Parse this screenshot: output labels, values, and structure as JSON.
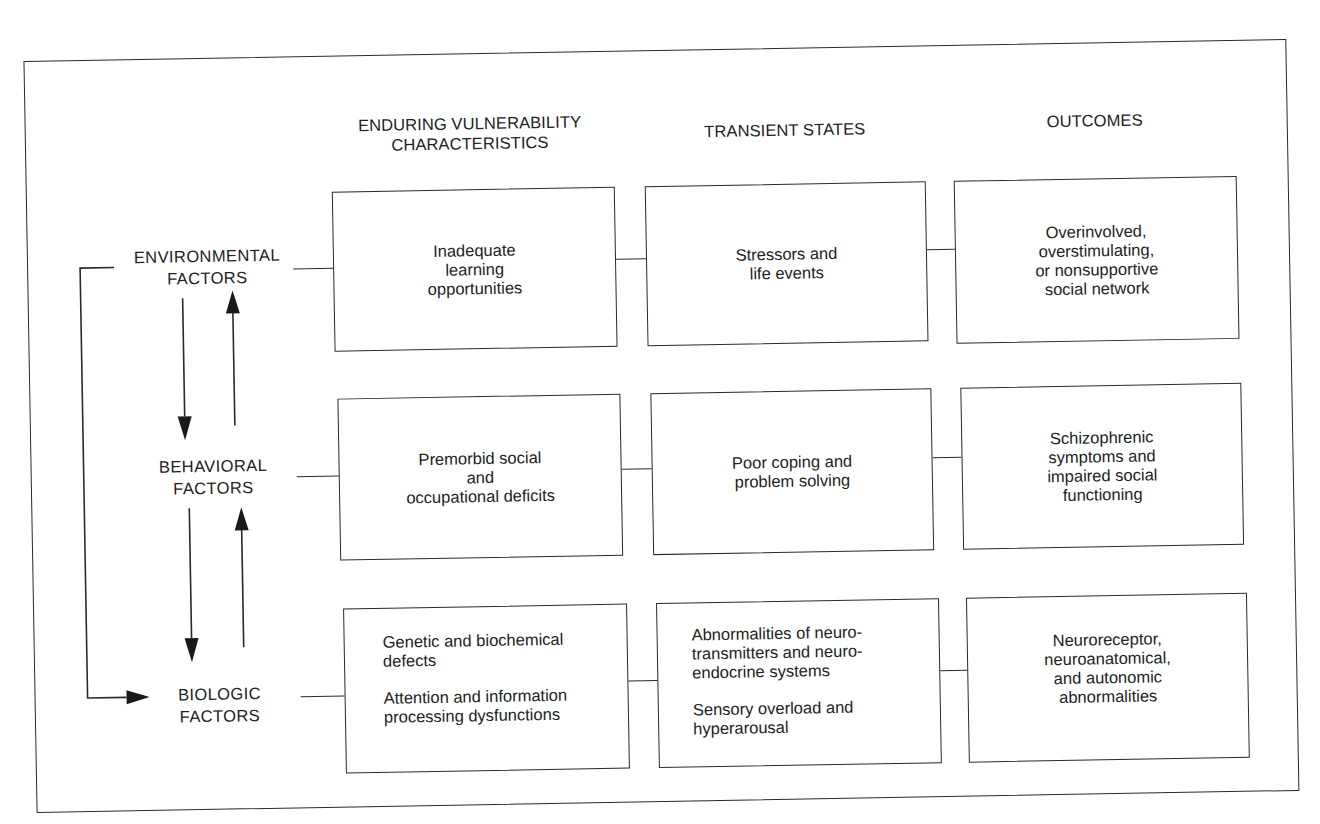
{
  "columns": {
    "vulnerability": "ENDURING VULNERABILITY\nCHARACTERISTICS",
    "transient": "TRANSIENT STATES",
    "outcomes": "OUTCOMES"
  },
  "factors": {
    "environmental": "ENVIRONMENTAL\nFACTORS",
    "behavioral": "BEHAVIORAL\nFACTORS",
    "biologic": "BIOLOGIC\nFACTORS"
  },
  "rows": [
    {
      "factor": "environmental",
      "vulnerability": [
        "Inadequate\nlearning\nopportunities"
      ],
      "transient": [
        "Stressors and\nlife events"
      ],
      "outcome": [
        "Overinvolved,\noverstimulating,\nor nonsupportive\nsocial network"
      ]
    },
    {
      "factor": "behavioral",
      "vulnerability": [
        "Premorbid social\nand\noccupational deficits"
      ],
      "transient": [
        "Poor coping and\nproblem solving"
      ],
      "outcome": [
        "Schizophrenic\nsymptoms and\nimpaired social\nfunctioning"
      ]
    },
    {
      "factor": "biologic",
      "vulnerability": [
        "Genetic and biochemical\n   defects",
        "Attention and information\n   processing dysfunctions"
      ],
      "transient": [
        "Abnormalities of neuro-\n   transmitters and neuro-\n   endocrine systems",
        "Sensory overload and\n   hyperarousal"
      ],
      "outcome": [
        "Neuroreceptor,\nneuroanatomical,\nand autonomic\nabnormalities"
      ]
    }
  ],
  "colors": {
    "line": "#2a2a2a",
    "text": "#222222",
    "background": "#ffffff"
  }
}
